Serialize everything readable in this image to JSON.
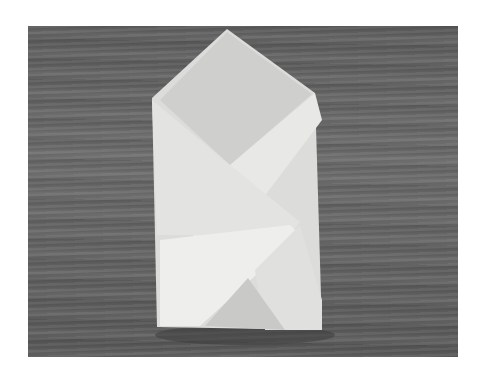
{
  "image": {
    "subject": "folded white paper packet on wooden surface",
    "colors": {
      "background": "#ffffff",
      "wood": "#646464",
      "paper": "#e6e6e4",
      "paper_shade": "#cfcfcd"
    }
  }
}
